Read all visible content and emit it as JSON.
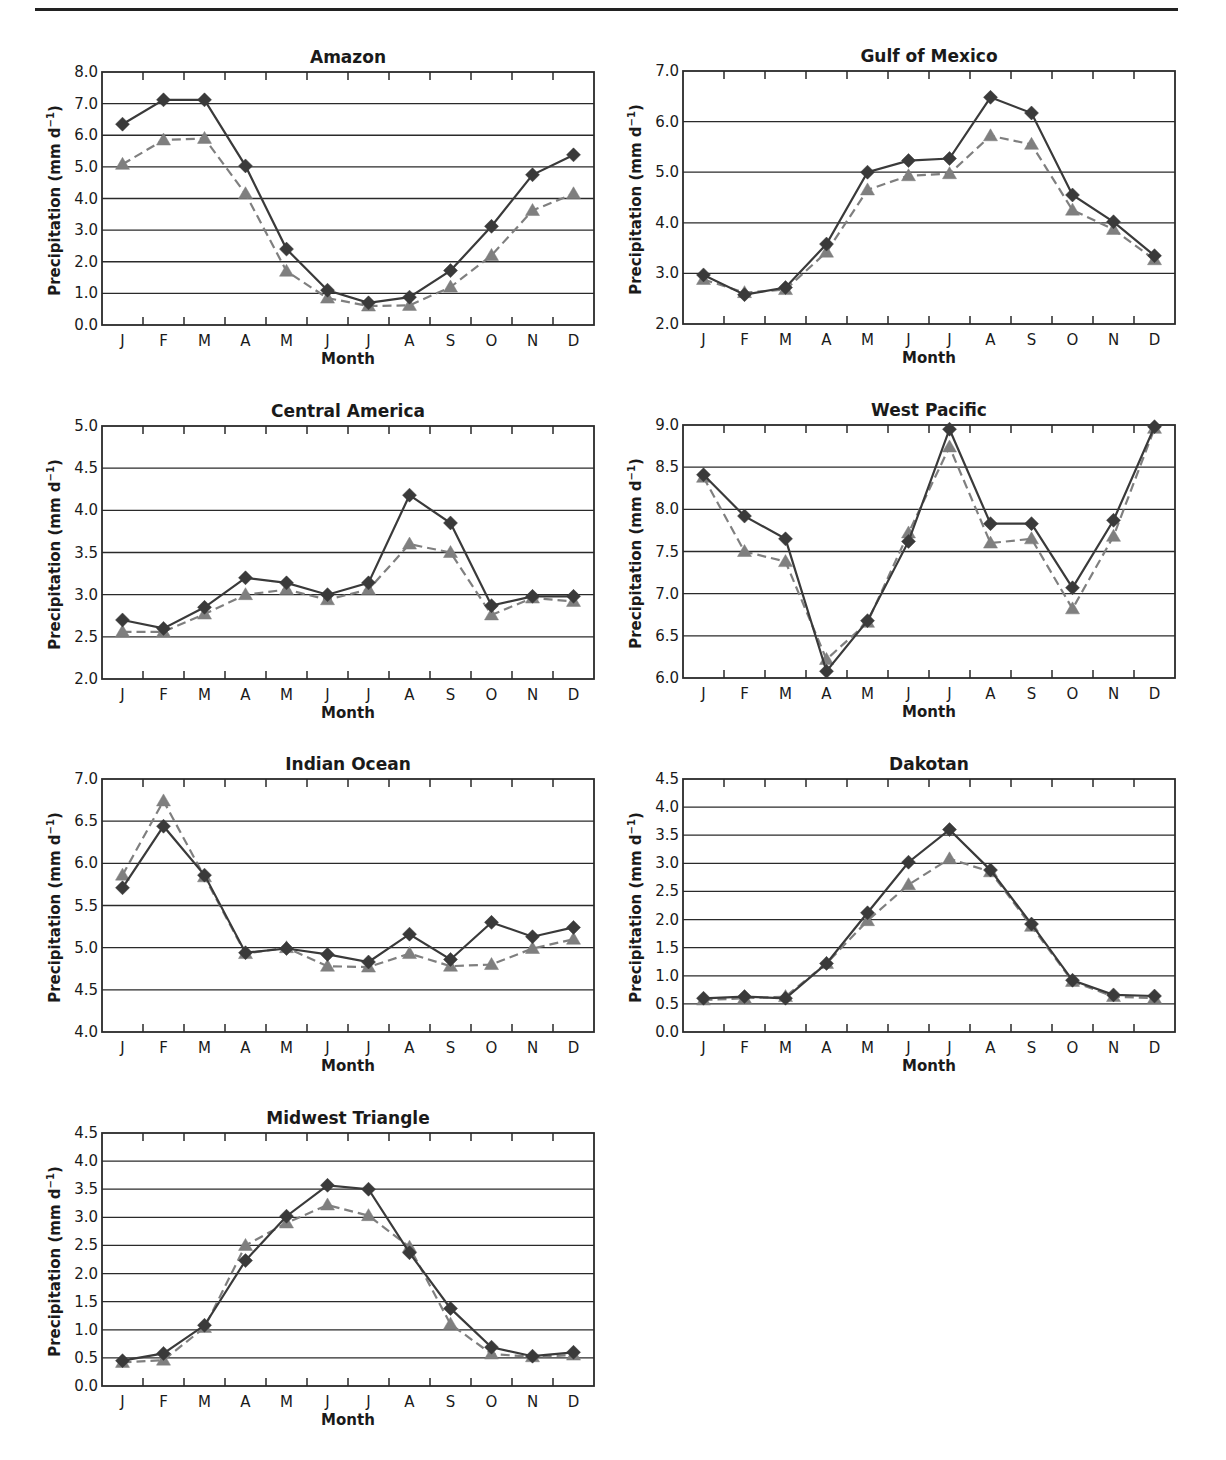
{
  "page": {
    "x_axis_label": "Month",
    "y_axis_label": "Precipitation (mm d",
    "y_axis_label_sup": "−1",
    "y_axis_label_close": ")"
  },
  "colors": {
    "observed_line": "#3a3a3a",
    "model_line": "#7f7f7f",
    "grid": "#2a2a2a",
    "frame": "#2a2a2a"
  },
  "chart_data": [
    {
      "type": "line",
      "title": "Amazon",
      "xlabel": "Month",
      "ylabel": "Precipitation (mm d⁻¹)",
      "categories": [
        "J",
        "F",
        "M",
        "A",
        "M",
        "J",
        "J",
        "A",
        "S",
        "O",
        "N",
        "D"
      ],
      "ylim": [
        0.0,
        8.0
      ],
      "yticks": [
        "0.0",
        "1.0",
        "2.0",
        "3.0",
        "4.0",
        "5.0",
        "6.0",
        "7.0",
        "8.0"
      ],
      "ystep": 1.0,
      "grid": true,
      "series": [
        {
          "name": "solid-diamond",
          "style": "solid",
          "marker": "diamond",
          "values": [
            6.35,
            7.12,
            7.12,
            5.03,
            2.4,
            1.1,
            0.7,
            0.88,
            1.72,
            3.12,
            4.75,
            5.38
          ]
        },
        {
          "name": "dashed-triangle",
          "style": "dashed",
          "marker": "triangle",
          "values": [
            5.08,
            5.85,
            5.9,
            4.15,
            1.7,
            0.85,
            0.6,
            0.62,
            1.2,
            2.2,
            3.62,
            4.15
          ]
        }
      ]
    },
    {
      "type": "line",
      "title": "Gulf of Mexico",
      "xlabel": "Month",
      "ylabel": "Precipitation (mm d⁻¹)",
      "categories": [
        "J",
        "F",
        "M",
        "A",
        "M",
        "J",
        "J",
        "A",
        "S",
        "O",
        "N",
        "D"
      ],
      "ylim": [
        2.0,
        7.0
      ],
      "yticks": [
        "2.0",
        "3.0",
        "4.0",
        "5.0",
        "6.0",
        "7.0"
      ],
      "ystep": 1.0,
      "grid": true,
      "series": [
        {
          "name": "solid-diamond",
          "style": "solid",
          "marker": "diamond",
          "values": [
            2.97,
            2.58,
            2.72,
            3.58,
            5.0,
            5.23,
            5.27,
            6.48,
            6.17,
            4.55,
            4.02,
            3.35
          ]
        },
        {
          "name": "dashed-triangle",
          "style": "dashed",
          "marker": "triangle",
          "values": [
            2.88,
            2.62,
            2.68,
            3.42,
            4.65,
            4.93,
            4.97,
            5.72,
            5.55,
            4.25,
            3.87,
            3.27
          ]
        }
      ]
    },
    {
      "type": "line",
      "title": "Central America",
      "xlabel": "Month",
      "ylabel": "Precipitation (mm d⁻¹)",
      "categories": [
        "J",
        "F",
        "M",
        "A",
        "M",
        "J",
        "J",
        "A",
        "S",
        "O",
        "N",
        "D"
      ],
      "ylim": [
        2.0,
        5.0
      ],
      "yticks": [
        "2.0",
        "2.5",
        "3.0",
        "3.5",
        "4.0",
        "4.5",
        "5.0"
      ],
      "ystep": 0.5,
      "grid": true,
      "series": [
        {
          "name": "solid-diamond",
          "style": "solid",
          "marker": "diamond",
          "values": [
            2.7,
            2.6,
            2.85,
            3.2,
            3.14,
            3.0,
            3.14,
            4.18,
            3.85,
            2.87,
            2.98,
            2.98
          ]
        },
        {
          "name": "dashed-triangle",
          "style": "dashed",
          "marker": "triangle",
          "values": [
            2.56,
            2.56,
            2.77,
            3.0,
            3.06,
            2.94,
            3.06,
            3.6,
            3.5,
            2.76,
            2.96,
            2.92
          ]
        }
      ]
    },
    {
      "type": "line",
      "title": "West Pacific",
      "xlabel": "Month",
      "ylabel": "Precipitation (mm d⁻¹)",
      "categories": [
        "J",
        "F",
        "M",
        "A",
        "M",
        "J",
        "J",
        "A",
        "S",
        "O",
        "N",
        "D"
      ],
      "ylim": [
        6.0,
        9.0
      ],
      "yticks": [
        "6.0",
        "6.5",
        "7.0",
        "7.5",
        "8.0",
        "8.5",
        "9.0"
      ],
      "ystep": 0.5,
      "grid": true,
      "series": [
        {
          "name": "solid-diamond",
          "style": "solid",
          "marker": "diamond",
          "values": [
            8.41,
            7.92,
            7.65,
            6.08,
            6.68,
            7.62,
            8.95,
            7.83,
            7.83,
            7.07,
            7.87,
            8.98
          ]
        },
        {
          "name": "dashed-triangle",
          "style": "dashed",
          "marker": "triangle",
          "values": [
            8.38,
            7.5,
            7.38,
            6.22,
            6.66,
            7.72,
            8.74,
            7.6,
            7.65,
            6.82,
            7.68,
            8.96
          ]
        }
      ]
    },
    {
      "type": "line",
      "title": "Indian Ocean",
      "xlabel": "Month",
      "ylabel": "Precipitation (mm d⁻¹)",
      "categories": [
        "J",
        "F",
        "M",
        "A",
        "M",
        "J",
        "J",
        "A",
        "S",
        "O",
        "N",
        "D"
      ],
      "ylim": [
        4.0,
        7.0
      ],
      "yticks": [
        "4.0",
        "4.5",
        "5.0",
        "5.5",
        "6.0",
        "6.5",
        "7.0"
      ],
      "ystep": 0.5,
      "grid": true,
      "series": [
        {
          "name": "solid-diamond",
          "style": "solid",
          "marker": "diamond",
          "values": [
            5.71,
            6.44,
            5.86,
            4.94,
            4.99,
            4.92,
            4.83,
            5.16,
            4.86,
            5.3,
            5.13,
            5.24
          ]
        },
        {
          "name": "dashed-triangle",
          "style": "dashed",
          "marker": "triangle",
          "values": [
            5.86,
            6.74,
            5.84,
            4.93,
            5.0,
            4.78,
            4.77,
            4.93,
            4.78,
            4.8,
            4.99,
            5.1
          ]
        }
      ]
    },
    {
      "type": "line",
      "title": "Dakotan",
      "xlabel": "Month",
      "ylabel": "Precipitation (mm d⁻¹)",
      "categories": [
        "J",
        "F",
        "M",
        "A",
        "M",
        "J",
        "J",
        "A",
        "S",
        "O",
        "N",
        "D"
      ],
      "ylim": [
        0.0,
        4.5
      ],
      "yticks": [
        "0.0",
        "0.5",
        "1.0",
        "1.5",
        "2.0",
        "2.5",
        "3.0",
        "3.5",
        "4.0",
        "4.5"
      ],
      "ystep": 0.5,
      "grid": true,
      "series": [
        {
          "name": "solid-diamond",
          "style": "solid",
          "marker": "diamond",
          "values": [
            0.6,
            0.63,
            0.6,
            1.22,
            2.12,
            3.02,
            3.6,
            2.88,
            1.92,
            0.92,
            0.66,
            0.64
          ]
        },
        {
          "name": "dashed-triangle",
          "style": "dashed",
          "marker": "triangle",
          "values": [
            0.57,
            0.6,
            0.63,
            1.22,
            1.98,
            2.62,
            3.08,
            2.85,
            1.88,
            0.9,
            0.63,
            0.6
          ]
        }
      ]
    },
    {
      "type": "line",
      "title": "Midwest Triangle",
      "xlabel": "Month",
      "ylabel": "Precipitation (mm d⁻¹)",
      "categories": [
        "J",
        "F",
        "M",
        "A",
        "M",
        "J",
        "J",
        "A",
        "S",
        "O",
        "N",
        "D"
      ],
      "ylim": [
        0.0,
        4.5
      ],
      "yticks": [
        "0.0",
        "0.5",
        "1.0",
        "1.5",
        "2.0",
        "2.5",
        "3.0",
        "3.5",
        "4.0",
        "4.5"
      ],
      "ystep": 0.5,
      "grid": true,
      "series": [
        {
          "name": "solid-diamond",
          "style": "solid",
          "marker": "diamond",
          "values": [
            0.45,
            0.58,
            1.08,
            2.23,
            3.02,
            3.57,
            3.5,
            2.37,
            1.38,
            0.69,
            0.53,
            0.6
          ]
        },
        {
          "name": "dashed-triangle",
          "style": "dashed",
          "marker": "triangle",
          "values": [
            0.42,
            0.46,
            1.04,
            2.5,
            2.9,
            3.22,
            3.03,
            2.47,
            1.1,
            0.57,
            0.52,
            0.55
          ]
        }
      ]
    }
  ]
}
